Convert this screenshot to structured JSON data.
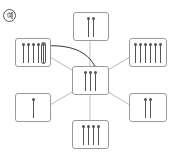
{
  "label": "예",
  "center": {
    "count": 3
  },
  "boxes": [
    {
      "name": "top",
      "count": 2
    },
    {
      "name": "top-left",
      "count": 5,
      "highlighted_last": true
    },
    {
      "name": "top-right",
      "count": 6
    },
    {
      "name": "bottom-left",
      "count": 1
    },
    {
      "name": "bottom-right",
      "count": 2
    },
    {
      "name": "bottom",
      "count": 4
    }
  ],
  "colors": {
    "line": "#aaaaaa",
    "arrow": "#333333",
    "stick": "#555555"
  }
}
